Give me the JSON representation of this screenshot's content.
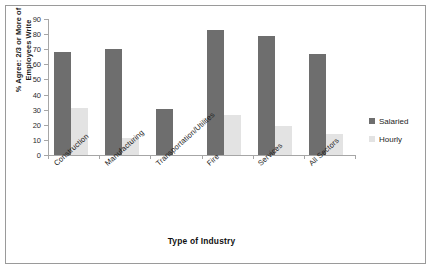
{
  "chart_data": {
    "type": "bar",
    "title": "",
    "xlabel": "Type of Industry",
    "ylabel": "% Agree: 2/3 or More of Employees Write",
    "ylabel_line1": "% Agree: 2/3 or More of",
    "ylabel_line2": "Employees Write",
    "categories": [
      "Construction",
      "Manufacturing",
      "Transportation/Utilites",
      "Fire",
      "Services",
      "All Sectors"
    ],
    "series": [
      {
        "name": "Salaried",
        "color": "#6e6e6e",
        "values": [
          68,
          70,
          30.5,
          83,
          79,
          67
        ]
      },
      {
        "name": "Hourly",
        "color": "#e3e3e3",
        "values": [
          31,
          11,
          0,
          26.5,
          19,
          14
        ]
      }
    ],
    "ylim": [
      0,
      90
    ],
    "yticks": [
      0,
      10,
      20,
      30,
      40,
      50,
      60,
      70,
      80,
      90
    ],
    "ytick_labels": [
      "0",
      "10",
      "20",
      "30",
      "40",
      "50",
      "60",
      "70",
      "80",
      "90"
    ],
    "grid": false,
    "legend_position": "right"
  },
  "legend": {
    "items": [
      {
        "label": "Salaried",
        "color": "#6e6e6e"
      },
      {
        "label": "Hourly",
        "color": "#e3e3e3"
      }
    ]
  }
}
